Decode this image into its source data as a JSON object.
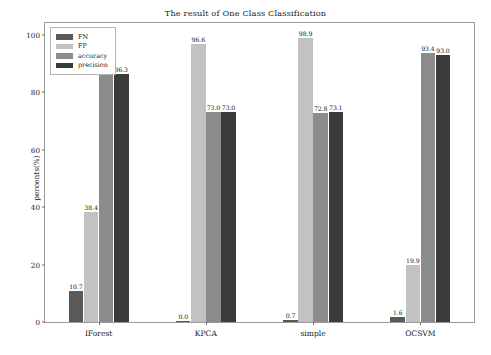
{
  "chart_data": {
    "type": "bar",
    "title": "The result of One Class Classification",
    "xlabel": "",
    "ylabel": "percents(%)",
    "ylim": [
      0,
      104
    ],
    "yticks": [
      0,
      20,
      40,
      60,
      80,
      100
    ],
    "ytick_labels": [
      "0",
      "20",
      "40",
      "60",
      "80",
      "100"
    ],
    "grid": false,
    "legend_position": "upper left",
    "categories": [
      "IForest",
      "KPCA",
      "simple",
      "OCSVM"
    ],
    "series": [
      {
        "name": "FN",
        "color": "#595959",
        "values": [
          10.7,
          0.0,
          0.7,
          1.6
        ],
        "labels": [
          "10.7",
          "0.0",
          "0.7",
          "1.6"
        ]
      },
      {
        "name": "FP",
        "color": "#c2c2c2",
        "values": [
          38.4,
          96.6,
          98.9,
          19.9
        ],
        "labels": [
          "38.4",
          "96.6",
          "98.9",
          "19.9"
        ]
      },
      {
        "name": "accuracy",
        "color": "#8c8c8c",
        "values": [
          86.3,
          73.0,
          72.8,
          93.4
        ],
        "labels": [
          "86.3",
          "73.0",
          "72.8",
          "93.4"
        ]
      },
      {
        "name": "precision",
        "color": "#3b3b3b",
        "values": [
          86.3,
          73.0,
          73.1,
          93.0
        ],
        "labels": [
          "86.3",
          "73.0",
          "73.1",
          "93.0"
        ]
      }
    ]
  }
}
